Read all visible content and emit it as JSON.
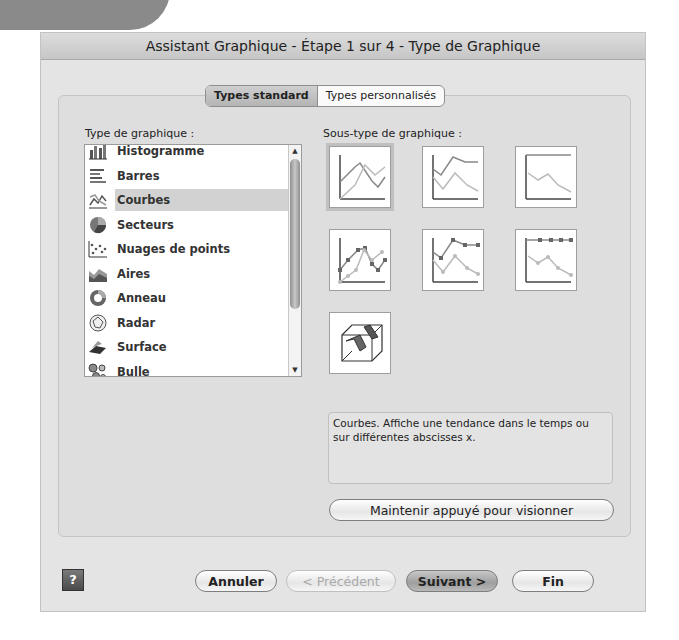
{
  "dialog": {
    "title": "Assistant Graphique - Étape 1 sur 4 - Type de Graphique"
  },
  "tabs": [
    {
      "label": "Types standard",
      "active": true
    },
    {
      "label": "Types personnalisés",
      "active": false
    }
  ],
  "chart_type": {
    "label": "Type de graphique :",
    "items": [
      {
        "label": "Histogramme",
        "icon": "column-chart-icon"
      },
      {
        "label": "Barres",
        "icon": "bar-chart-icon"
      },
      {
        "label": "Courbes",
        "icon": "line-chart-icon",
        "selected": true
      },
      {
        "label": "Secteurs",
        "icon": "pie-chart-icon"
      },
      {
        "label": "Nuages de points",
        "icon": "scatter-chart-icon"
      },
      {
        "label": "Aires",
        "icon": "area-chart-icon"
      },
      {
        "label": "Anneau",
        "icon": "doughnut-chart-icon"
      },
      {
        "label": "Radar",
        "icon": "radar-chart-icon"
      },
      {
        "label": "Surface",
        "icon": "surface-chart-icon"
      },
      {
        "label": "Bulle",
        "icon": "bubble-chart-icon"
      }
    ]
  },
  "subtype": {
    "label": "Sous-type de graphique :",
    "description": "Courbes. Affiche une tendance dans le temps ou sur différentes abscisses x.",
    "preview_button": "Maintenir appuyé pour visionner"
  },
  "footer": {
    "help": "?",
    "cancel": "Annuler",
    "previous": "< Précédent",
    "next": "Suivant >",
    "finish": "Fin"
  }
}
